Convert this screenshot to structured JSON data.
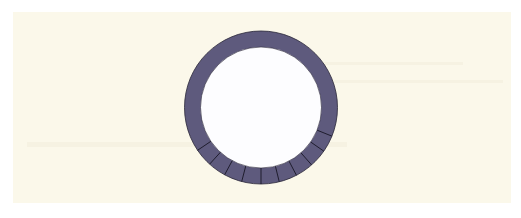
{
  "diagram": {
    "type": "segmented-ring",
    "colors": {
      "page_background": "#ffffff",
      "panel_background": "#fbf8ea",
      "ring_fill": "#5e5a7d",
      "ring_stroke": "#2a2738",
      "inner_fill": "#fdfdff",
      "tick_color": "#1f1d2e"
    },
    "ring": {
      "center_x": 261,
      "center_y": 107.5,
      "outer_radius": 76.5,
      "inner_radius": 60.5
    },
    "ticks": {
      "count": 10,
      "angles_from_bottom_deg": [
        -56,
        -42.2,
        -28.4,
        -14.6,
        0,
        13.8,
        27.6,
        41.4,
        55.2,
        68
      ]
    }
  }
}
